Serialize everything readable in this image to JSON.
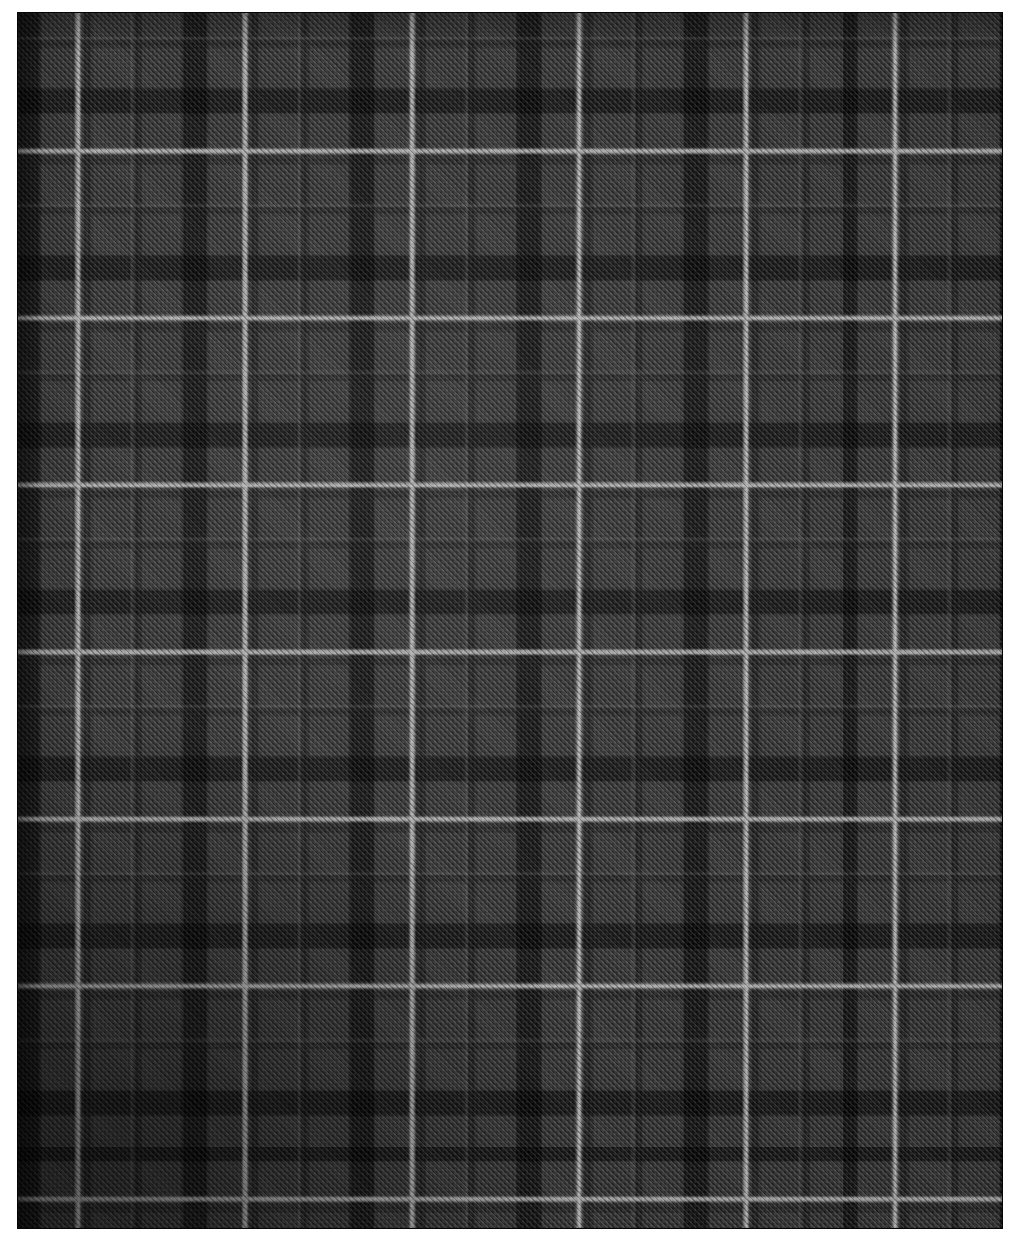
{
  "image": {
    "subject": "Tartan plaid wool fabric swatch",
    "description": "Close-up photograph of a dark charcoal and black tartan check fabric with thin light-grey overcheck lines, woven in a diagonal twill",
    "canvas_width": 1017,
    "canvas_height": 1242,
    "background_color": "#ffffff"
  },
  "fabric": {
    "name": "fabric-swatch",
    "left": 18,
    "top": 13,
    "width": 984,
    "height": 1215,
    "weave": "twill",
    "texture": "houndstooth-twill"
  },
  "palette": {
    "ground_black": "#0a0a0a",
    "dark_charcoal": "#151515",
    "mid_charcoal": "#2e2e2e",
    "block_grey": "#3a3a3a",
    "overcheck_silver": "#b0b0b0",
    "guard_grey": "#7a7a7a",
    "paper_white": "#ffffff"
  },
  "sett": {
    "repeat_px": 167,
    "overcheck_line_width_px": 6,
    "vertical_overcheck_x": [
      75,
      240,
      405,
      570,
      735,
      897
    ],
    "horizontal_overcheck_y": [
      148,
      315,
      483,
      650,
      818,
      985,
      1152
    ],
    "sub_block_count_per_repeat": 3,
    "twill_angle_deg": 45
  },
  "labels": {
    "swatch_title": "Tartan Plaid Swatch",
    "weave_label": "Twill",
    "colour_label": "Charcoal / Black / Silver Overcheck"
  }
}
